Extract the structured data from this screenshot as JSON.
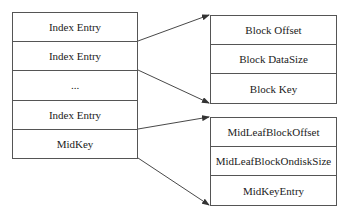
{
  "diagram": {
    "left_box": {
      "rows": [
        "Index Entry",
        "Index Entry",
        "...",
        "Index Entry",
        "MidKey"
      ]
    },
    "top_right_box": {
      "rows": [
        "Block Offset",
        "Block DataSize",
        "Block Key"
      ]
    },
    "bottom_right_box": {
      "rows": [
        "MidLeafBlockOffset",
        "MidLeafBlockOndiskSize",
        "MidKeyEntry"
      ]
    },
    "connections": [
      {
        "from": "left_box.row1_bottom",
        "to": "top_right_box.top"
      },
      {
        "from": "left_box.row2_bottom",
        "to": "top_right_box.bottom"
      },
      {
        "from": "left_box.row4_bottom",
        "to": "bottom_right_box.top"
      },
      {
        "from": "left_box.row5_bottom",
        "to": "bottom_right_box.bottom"
      }
    ],
    "colors": {
      "line": "#333333",
      "border": "#555555",
      "text": "#222222",
      "background": "#ffffff"
    }
  }
}
